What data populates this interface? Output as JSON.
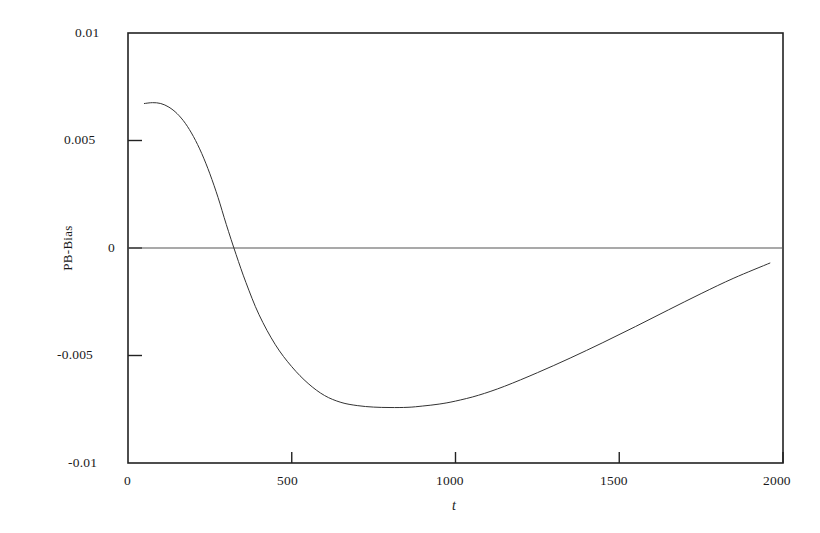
{
  "chart_data": {
    "type": "line",
    "title": "",
    "subtitle": "",
    "xlabel": "t",
    "ylabel": "PB-Bias",
    "xlim": [
      0,
      2000
    ],
    "ylim": [
      -0.01,
      0.01
    ],
    "grid": false,
    "legend": null,
    "xticks": [
      0,
      500,
      1000,
      1500,
      2000
    ],
    "xtick_labels": [
      "0",
      "500",
      "1000",
      "1500",
      "2000"
    ],
    "yticks": [
      0.01,
      0.005,
      0,
      -0.005,
      -0.01
    ],
    "ytick_labels": [
      "0.01",
      "0.005",
      "0",
      "-0.005",
      "-0.01"
    ],
    "reference_lines": [
      {
        "axis": "y",
        "value": 0,
        "style": "solid",
        "color": "#555555"
      }
    ],
    "series": [
      {
        "name": "PB-Bias",
        "color": "#333333",
        "linewidth": 1,
        "x": [
          50,
          75,
          100,
          125,
          150,
          175,
          200,
          225,
          250,
          275,
          300,
          330,
          360,
          400,
          450,
          500,
          550,
          600,
          650,
          700,
          750,
          800,
          855,
          900,
          950,
          1000,
          1070,
          1150,
          1250,
          1350,
          1450,
          1550,
          1650,
          1750,
          1850,
          1960
        ],
        "y": [
          0.00672,
          0.00676,
          0.00672,
          0.00655,
          0.00625,
          0.0058,
          0.00518,
          0.0044,
          0.00345,
          0.00235,
          0.0011,
          -0.0003,
          -0.0016,
          -0.0031,
          -0.0045,
          -0.00552,
          -0.0063,
          -0.00686,
          -0.00718,
          -0.00733,
          -0.0074,
          -0.00742,
          -0.00741,
          -0.00735,
          -0.00726,
          -0.00712,
          -0.00685,
          -0.00643,
          -0.0058,
          -0.00512,
          -0.0044,
          -0.00365,
          -0.00288,
          -0.00212,
          -0.0014,
          -0.0007
        ]
      }
    ],
    "annotations": []
  },
  "figure": {
    "background_color": "#ffffff",
    "frame_color": "#222222"
  }
}
